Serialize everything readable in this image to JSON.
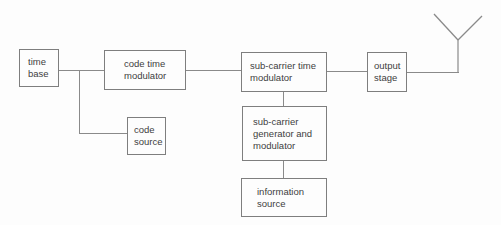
{
  "diagram": {
    "type": "block-diagram",
    "colors": {
      "background": "#fdfdfd",
      "box_border": "#7e7e7e",
      "text": "#3e3e3e",
      "connector": "#8a8a8a"
    },
    "blocks": {
      "time_base": {
        "label": "time\nbase"
      },
      "code_time_modulator": {
        "label": "code time\nmodulator"
      },
      "sub_carrier_time_modulator": {
        "label": "sub-carrier time\nmodulator"
      },
      "output_stage": {
        "label": "output\nstage"
      },
      "code_source": {
        "label": "code\nsource"
      },
      "sub_carrier_generator_and_modulator": {
        "label": "sub-carrier\ngenerator and\nmodulator"
      },
      "information_source": {
        "label": "information\nsource"
      }
    },
    "icons": {
      "antenna": "antenna-icon"
    },
    "edges": [
      {
        "from": "time_base",
        "to": "code_time_modulator"
      },
      {
        "from": "time_base",
        "to": "code_source"
      },
      {
        "from": "code_time_modulator",
        "to": "sub_carrier_time_modulator"
      },
      {
        "from": "sub_carrier_time_modulator",
        "to": "output_stage"
      },
      {
        "from": "output_stage",
        "to": "antenna"
      },
      {
        "from": "sub_carrier_generator_and_modulator",
        "to": "sub_carrier_time_modulator"
      },
      {
        "from": "information_source",
        "to": "sub_carrier_generator_and_modulator"
      }
    ]
  }
}
